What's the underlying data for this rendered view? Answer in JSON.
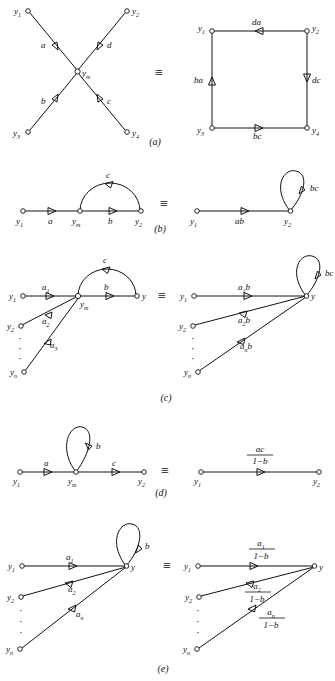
{
  "figure": {
    "type": "signal-flow-graph-equivalences",
    "panels": [
      {
        "id": "a",
        "panel_label": "(a)",
        "equiv_symbol": "≡",
        "left": {
          "shape": "X-crossing",
          "nodes": [
            {
              "name": "y1",
              "base": "y",
              "sub": "1",
              "pos": "top-left"
            },
            {
              "name": "y2",
              "base": "y",
              "sub": "2",
              "pos": "top-right"
            },
            {
              "name": "y3",
              "base": "y",
              "sub": "3",
              "pos": "bottom-left"
            },
            {
              "name": "y4",
              "base": "y",
              "sub": "4",
              "pos": "bottom-right"
            },
            {
              "name": "ym",
              "base": "y",
              "sub": "m",
              "pos": "center"
            }
          ],
          "edges": [
            {
              "label": "a",
              "from": "ym",
              "to": "y1",
              "arrow_dir": "up-left"
            },
            {
              "label": "d",
              "from": "y2",
              "to": "ym",
              "arrow_dir": "down-left"
            },
            {
              "label": "b",
              "from": "y3",
              "to": "ym",
              "arrow_dir": "up-right"
            },
            {
              "label": "c",
              "from": "ym",
              "to": "y4",
              "arrow_dir": "down-right"
            }
          ]
        },
        "right": {
          "shape": "square",
          "nodes": [
            {
              "name": "y1",
              "base": "y",
              "sub": "1",
              "pos": "top-left"
            },
            {
              "name": "y2",
              "base": "y",
              "sub": "2",
              "pos": "top-right"
            },
            {
              "name": "y3",
              "base": "y",
              "sub": "3",
              "pos": "bottom-left"
            },
            {
              "name": "y4",
              "base": "y",
              "sub": "4",
              "pos": "bottom-right"
            }
          ],
          "edges": [
            {
              "label": "da",
              "from": "y2",
              "to": "y1",
              "side": "top",
              "arrow_dir": "left"
            },
            {
              "label": "ba",
              "from": "y3",
              "to": "y1",
              "side": "left",
              "arrow_dir": "up"
            },
            {
              "label": "dc",
              "from": "y2",
              "to": "y4",
              "side": "right",
              "arrow_dir": "down"
            },
            {
              "label": "bc",
              "from": "y3",
              "to": "y4",
              "side": "bottom",
              "arrow_dir": "right"
            }
          ]
        }
      },
      {
        "id": "b",
        "panel_label": "(b)",
        "equiv_symbol": "≡",
        "left": {
          "nodes": [
            {
              "name": "y1",
              "base": "y",
              "sub": "1"
            },
            {
              "name": "ym",
              "base": "y",
              "sub": "m"
            },
            {
              "name": "y2",
              "base": "y",
              "sub": "2"
            }
          ],
          "edges": [
            {
              "label": "a",
              "from": "y1",
              "to": "ym",
              "arrow_dir": "right"
            },
            {
              "label": "b",
              "from": "ym",
              "to": "y2",
              "arrow_dir": "right"
            },
            {
              "label": "c",
              "from": "y2",
              "to": "ym",
              "shape": "arc-above",
              "arrow_dir": "left"
            }
          ]
        },
        "right": {
          "nodes": [
            {
              "name": "y1",
              "base": "y",
              "sub": "1"
            },
            {
              "name": "y2",
              "base": "y",
              "sub": "2"
            }
          ],
          "edges": [
            {
              "label": "ab",
              "from": "y1",
              "to": "y2",
              "arrow_dir": "right"
            },
            {
              "label": "bc",
              "from": "y2",
              "to": "y2",
              "shape": "self-loop",
              "arrow_dir": "up"
            }
          ]
        }
      },
      {
        "id": "c",
        "panel_label": "(c)",
        "equiv_symbol": "≡",
        "left": {
          "nodes": [
            {
              "name": "y1",
              "base": "y",
              "sub": "1"
            },
            {
              "name": "y2",
              "base": "y",
              "sub": "2"
            },
            {
              "name": "yn",
              "base": "y",
              "sub": "n"
            },
            {
              "name": "ym",
              "base": "y",
              "sub": "m"
            },
            {
              "name": "y",
              "base": "y",
              "sub": ""
            }
          ],
          "vertical_dots": "·",
          "edges": [
            {
              "label": "a1",
              "base": "a",
              "sub": "1",
              "from": "y1",
              "to": "ym",
              "arrow_dir": "right"
            },
            {
              "label": "a2",
              "base": "a",
              "sub": "2",
              "from": "y2",
              "to": "ym",
              "arrow_dir": "up-right"
            },
            {
              "label": "a3",
              "base": "a",
              "sub": "3",
              "from": "yn",
              "to": "ym",
              "arrow_dir": "up-right"
            },
            {
              "label": "b",
              "from": "ym",
              "to": "y",
              "arrow_dir": "right"
            },
            {
              "label": "c",
              "from": "y",
              "to": "ym",
              "shape": "arc-above",
              "arrow_dir": "left"
            }
          ]
        },
        "right": {
          "nodes": [
            {
              "name": "y1",
              "base": "y",
              "sub": "1"
            },
            {
              "name": "y2",
              "base": "y",
              "sub": "2"
            },
            {
              "name": "yn",
              "base": "y",
              "sub": "n"
            },
            {
              "name": "y",
              "base": "y",
              "sub": ""
            }
          ],
          "vertical_dots": "·",
          "edges": [
            {
              "label": "a1b",
              "base": "a",
              "sub": "1",
              "tail": "b",
              "from": "y1",
              "to": "y",
              "arrow_dir": "right"
            },
            {
              "label": "a2b",
              "base": "a",
              "sub": "2",
              "tail": "b",
              "from": "y2",
              "to": "y",
              "arrow_dir": "up-right"
            },
            {
              "label": "anb",
              "base": "a",
              "sub": "n",
              "tail": "b",
              "from": "yn",
              "to": "y",
              "arrow_dir": "up-right"
            },
            {
              "label": "bc",
              "from": "y",
              "to": "y",
              "shape": "self-loop",
              "arrow_dir": "up"
            }
          ]
        }
      },
      {
        "id": "d",
        "panel_label": "(d)",
        "equiv_symbol": "≡",
        "left": {
          "nodes": [
            {
              "name": "y1",
              "base": "y",
              "sub": "1"
            },
            {
              "name": "ym",
              "base": "y",
              "sub": "m"
            },
            {
              "name": "y2",
              "base": "y",
              "sub": "2"
            }
          ],
          "edges": [
            {
              "label": "a",
              "from": "y1",
              "to": "ym",
              "arrow_dir": "right"
            },
            {
              "label": "c",
              "from": "ym",
              "to": "y2",
              "arrow_dir": "right"
            },
            {
              "label": "b",
              "from": "ym",
              "to": "ym",
              "shape": "self-loop",
              "arrow_dir": "down"
            }
          ]
        },
        "right": {
          "nodes": [
            {
              "name": "y1",
              "base": "y",
              "sub": "1"
            },
            {
              "name": "y2",
              "base": "y",
              "sub": "2"
            }
          ],
          "edges": [
            {
              "label": "ac/(1-b)",
              "numerator": "ac",
              "denominator": "1−b",
              "from": "y1",
              "to": "y2",
              "arrow_dir": "right"
            }
          ]
        }
      },
      {
        "id": "e",
        "panel_label": "(e)",
        "equiv_symbol": "≡",
        "left": {
          "nodes": [
            {
              "name": "y1",
              "base": "y",
              "sub": "1"
            },
            {
              "name": "y2",
              "base": "y",
              "sub": "2"
            },
            {
              "name": "yn",
              "base": "y",
              "sub": "n"
            },
            {
              "name": "y",
              "base": "y",
              "sub": ""
            }
          ],
          "vertical_dots": "·",
          "edges": [
            {
              "label": "a1",
              "base": "a",
              "sub": "1",
              "from": "y1",
              "to": "y",
              "arrow_dir": "right"
            },
            {
              "label": "a2",
              "base": "a",
              "sub": "2",
              "from": "y2",
              "to": "y",
              "arrow_dir": "up-right"
            },
            {
              "label": "an",
              "base": "a",
              "sub": "n",
              "from": "yn",
              "to": "y",
              "arrow_dir": "up-right"
            },
            {
              "label": "b",
              "from": "y",
              "to": "y",
              "shape": "self-loop",
              "arrow_dir": "down"
            }
          ]
        },
        "right": {
          "nodes": [
            {
              "name": "y1",
              "base": "y",
              "sub": "1"
            },
            {
              "name": "y2",
              "base": "y",
              "sub": "2"
            },
            {
              "name": "yn",
              "base": "y",
              "sub": "n"
            },
            {
              "name": "y",
              "base": "y",
              "sub": ""
            }
          ],
          "vertical_dots": "·",
          "edges": [
            {
              "label": "a1/(1-b)",
              "num_base": "a",
              "num_sub": "1",
              "denominator": "1−b",
              "from": "y1",
              "to": "y",
              "arrow_dir": "right"
            },
            {
              "label": "a2/(1-b)",
              "num_base": "a",
              "num_sub": "2",
              "denominator": "1−b",
              "from": "y2",
              "to": "y",
              "arrow_dir": "up-right"
            },
            {
              "label": "an/(1-b)",
              "num_base": "a",
              "num_sub": "n",
              "denominator": "1−b",
              "from": "yn",
              "to": "y",
              "arrow_dir": "up-right"
            }
          ]
        }
      }
    ],
    "colors": {
      "ink": "#111111",
      "paper": "#ffffff"
    }
  }
}
